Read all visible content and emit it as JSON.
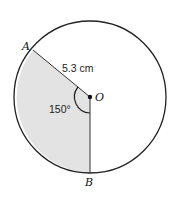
{
  "diagram": {
    "points": {
      "A": "A",
      "O": "O",
      "B": "B"
    },
    "radius_label": "5.3 cm",
    "angle_label": "150°",
    "colors": {
      "sector_fill": "#e3e3e3",
      "stroke": "#222222",
      "background": "#ffffff"
    }
  }
}
